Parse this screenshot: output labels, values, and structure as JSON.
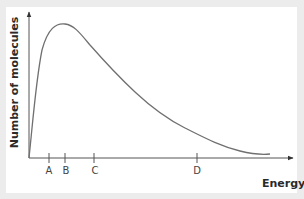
{
  "chart_data": {
    "type": "line",
    "title": "",
    "xlabel": "Energy",
    "ylabel": "Number of molecules",
    "grid": false,
    "legend": null,
    "x_ticks": [
      "A",
      "B",
      "C",
      "D"
    ],
    "series": [
      {
        "name": "Maxwell-Boltzmann distribution",
        "shape": "right-skewed curve rising steeply from origin, peaking near B, decaying asymptotically toward the energy axis"
      }
    ],
    "annotations": {
      "peak_at_tick": "B"
    }
  },
  "labels": {
    "ylabel": "Number of molecules",
    "xlabel": "Energy",
    "ticks": {
      "a": "A",
      "b": "B",
      "c": "C",
      "d": "D"
    }
  },
  "colors": {
    "background": "#ececec",
    "panel": "#ffffff",
    "axis": "#555555",
    "curve": "#707070",
    "text": "#2a2a2a"
  }
}
